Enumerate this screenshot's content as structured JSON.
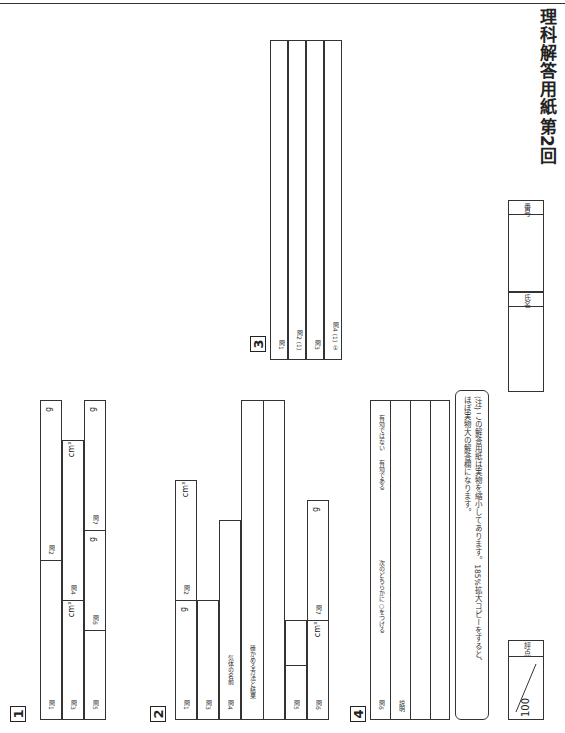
{
  "header": {
    "title": "理科解答用紙",
    "round": "第2回",
    "number_label": "番号",
    "name_label": "氏名",
    "score_label": "評点",
    "score_max": "100"
  },
  "note": {
    "line1": "(注) この解答用紙は実物を縮小してあります。185%拡大コピーをすると、",
    "line2": "ほぼ実物大の解答欄になります。"
  },
  "sec1": {
    "num": "1",
    "q1": "問1",
    "q2": "問2",
    "q3": "問3",
    "q4": "問4",
    "q5": "問5",
    "q6": "問6",
    "q7": "問7",
    "g": "g",
    "cm3": "cm³"
  },
  "sec2": {
    "num": "2",
    "q1": "問1",
    "q2": "問2",
    "q3": "問3",
    "q4": "問4",
    "q4_gas": "気体の名前",
    "q4_check": "確かめる方法と結果",
    "q5": "問5",
    "q6": "問6",
    "q7": "問7",
    "g": "g",
    "cm3": "cm³"
  },
  "sec3": {
    "num": "3",
    "q1": "問1",
    "q2_1": "問2 (1)",
    "q2_2": "(2)",
    "q3": "問3",
    "q4_1": "問4 (1) ①",
    "q4_2": "②",
    "q4_3": "③",
    "q4_p2": "(2)",
    "q5": "問5",
    "q6": "問6",
    "q7": "問7",
    "times": "倍",
    "year": "年",
    "speed": "時速",
    "km": "km"
  },
  "sec4": {
    "num": "4",
    "q1": "問1",
    "q2": "問2 B",
    "q2c": "C",
    "q2d": "D",
    "q3": "問3 E",
    "q3f": "F",
    "q4": "問4",
    "q5_1": "問5 (1)",
    "q5_2": "(2)",
    "q6": "問6",
    "q6_text": "次のどちらかに○をつける",
    "q6_a": "有効である",
    "q6_sep": "・",
    "q6_b": "有効ではない",
    "expl": "説明"
  }
}
